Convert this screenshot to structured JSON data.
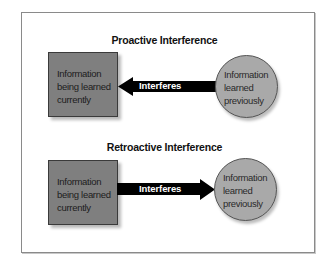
{
  "diagrams": [
    {
      "title": "Proactive Interference",
      "box_label_lines": [
        "Information",
        "being learned",
        "currently"
      ],
      "circle_label_lines": [
        "Information",
        "learned",
        "previously"
      ],
      "arrow_label": "Interferes",
      "arrow_direction": "left"
    },
    {
      "title": "Retroactive Interference",
      "box_label_lines": [
        "Information",
        "being learned",
        "currently"
      ],
      "circle_label_lines": [
        "Information",
        "learned",
        "previously"
      ],
      "arrow_label": "Interferes",
      "arrow_direction": "right"
    }
  ],
  "colors": {
    "box_fill": "#7f7f7f",
    "circle_fill": "#a9a9a9",
    "arrow_fill": "#000000",
    "frame_border": "#8a8a8a"
  }
}
